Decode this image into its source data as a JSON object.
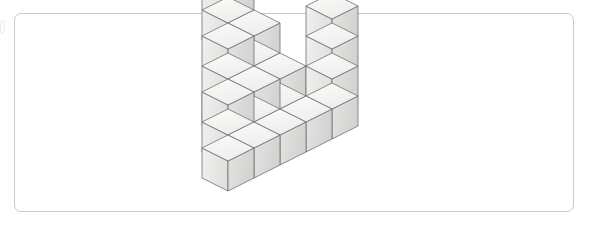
{
  "figure": {
    "frame": {
      "x": 14,
      "y": 13,
      "width": 560,
      "height": 199,
      "border_color": "#c9c9c9",
      "border_radius": 7,
      "background": "#ffffff"
    },
    "edge_mark": {
      "name": "page-edge-artifact",
      "x": 0,
      "y": 20,
      "width": 5,
      "height": 14
    },
    "palette": {
      "top_face": "#f4f4f2",
      "left_face": "#e9e9e7",
      "right_face": "#dadad8",
      "outline": "#6e6e6e",
      "background": "#ffffff"
    },
    "projection": {
      "type": "isometric",
      "origin_x": 228,
      "origin_y": 178,
      "half_width": 26,
      "half_depth": 13,
      "cube_height": 30
    },
    "cube_count": 20,
    "cubes": [
      {
        "name": "cube-front-left-base",
        "x": 0,
        "y": 0,
        "z": 0
      },
      {
        "name": "cube-row1-mid",
        "x": 1,
        "y": 0,
        "z": 0
      },
      {
        "name": "cube-row1-right",
        "x": 2,
        "y": 0,
        "z": 0
      },
      {
        "name": "cube-row1-gap-fill",
        "x": 3,
        "y": 0,
        "z": 0
      },
      {
        "name": "cube-row1-far-right",
        "x": 4,
        "y": 0,
        "z": 0
      },
      {
        "name": "cube-row2-left",
        "x": 1,
        "y": 1,
        "z": 0
      },
      {
        "name": "cube-row2-mid",
        "x": 2,
        "y": 1,
        "z": 0
      },
      {
        "name": "cube-row2-right",
        "x": 3,
        "y": 1,
        "z": 0
      },
      {
        "name": "cube-tier2-left",
        "x": 1,
        "y": 1,
        "z": 1
      },
      {
        "name": "cube-tier2-mid",
        "x": 2,
        "y": 1,
        "z": 1
      },
      {
        "name": "cube-tier2-right",
        "x": 3,
        "y": 1,
        "z": 1
      },
      {
        "name": "cube-row3-left",
        "x": 2,
        "y": 2,
        "z": 0
      },
      {
        "name": "cube-tier2-back-left",
        "x": 2,
        "y": 2,
        "z": 1
      },
      {
        "name": "cube-tier3-back-left",
        "x": 2,
        "y": 2,
        "z": 2
      },
      {
        "name": "cube-row3-right",
        "x": 3,
        "y": 2,
        "z": 0
      },
      {
        "name": "cube-tier2-back-right",
        "x": 3,
        "y": 2,
        "z": 1
      },
      {
        "name": "cube-tier3-back-right",
        "x": 3,
        "y": 2,
        "z": 2
      },
      {
        "name": "cube-tower-level3",
        "x": 3,
        "y": 3,
        "z": 2
      },
      {
        "name": "cube-tower-level4",
        "x": 3,
        "y": 3,
        "z": 3
      },
      {
        "name": "cube-right-col-l2",
        "x": 4,
        "y": 0,
        "z": 1
      },
      {
        "name": "cube-right-col-l3",
        "x": 4,
        "y": 0,
        "z": 2
      },
      {
        "name": "cube-right-col-l4",
        "x": 4,
        "y": 0,
        "z": 3
      }
    ]
  }
}
